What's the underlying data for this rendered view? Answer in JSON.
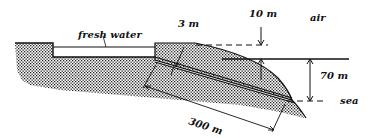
{
  "diagram": {
    "labels": {
      "fresh_water": "fresh water",
      "thickness": "3 m",
      "height_above": "10 m",
      "air": "air",
      "depth": "70 m",
      "sea": "sea",
      "length": "300 m"
    },
    "colors": {
      "ink": "#111111",
      "background": "#ffffff"
    }
  }
}
